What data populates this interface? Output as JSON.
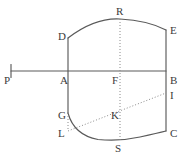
{
  "figure": {
    "type": "geometry-diagram",
    "canvas": {
      "width": 190,
      "height": 159,
      "background": "#ffffff"
    },
    "stroke_colors": {
      "solid": "#5a5a5a",
      "dotted": "#8a8a8a",
      "label": "#3b3b3b"
    },
    "vertices": [
      {
        "id": "P",
        "label": "P",
        "x": 11,
        "y": 71,
        "label_x": 4,
        "label_y": 75
      },
      {
        "id": "A",
        "label": "A",
        "x": 68,
        "y": 71,
        "label_x": 60,
        "label_y": 75
      },
      {
        "id": "F",
        "label": "F",
        "x": 120,
        "y": 71,
        "label_x": 112,
        "label_y": 75
      },
      {
        "id": "B",
        "label": "B",
        "x": 166,
        "y": 71,
        "label_x": 170,
        "label_y": 75
      },
      {
        "id": "D",
        "label": "D",
        "x": 68,
        "y": 38,
        "label_x": 58,
        "label_y": 31
      },
      {
        "id": "R",
        "label": "R",
        "x": 120,
        "y": 19,
        "label_x": 116,
        "label_y": 6
      },
      {
        "id": "E",
        "label": "E",
        "x": 166,
        "y": 30,
        "label_x": 170,
        "label_y": 25
      },
      {
        "id": "G",
        "label": "G",
        "x": 68,
        "y": 113,
        "label_x": 58,
        "label_y": 110
      },
      {
        "id": "I",
        "label": "I",
        "x": 166,
        "y": 93,
        "label_x": 170,
        "label_y": 90
      },
      {
        "id": "K",
        "label": "K",
        "x": 120,
        "y": 115,
        "label_x": 111,
        "label_y": 110
      },
      {
        "id": "L",
        "label": "L",
        "x": 68,
        "y": 131,
        "label_x": 58,
        "label_y": 128
      },
      {
        "id": "C",
        "label": "C",
        "x": 166,
        "y": 131,
        "label_x": 170,
        "label_y": 128
      },
      {
        "id": "S",
        "label": "S",
        "x": 120,
        "y": 140,
        "label_x": 115,
        "label_y": 143
      }
    ],
    "segments": [
      {
        "name": "baseline-P-B",
        "from": "P",
        "to": "B",
        "style": "solid"
      },
      {
        "name": "tick-at-P",
        "style": "solid",
        "kind": "tick"
      },
      {
        "name": "left-edge-D-G",
        "from": "D",
        "to": "G",
        "style": "solid"
      },
      {
        "name": "right-edge-E-C",
        "from": "E",
        "to": "C",
        "style": "solid"
      },
      {
        "name": "axis-R-S",
        "from": "R",
        "to": "S",
        "style": "dotted"
      },
      {
        "name": "chord-L-I",
        "from": "L",
        "to": "I",
        "style": "dotted"
      },
      {
        "name": "segment-G-L",
        "from": "G",
        "to": "L",
        "style": "dotted"
      }
    ],
    "arcs": [
      {
        "name": "top-arc-D-R-E",
        "from": "D",
        "through": "R",
        "to": "E",
        "style": "solid",
        "bulge": "up"
      },
      {
        "name": "bottom-arc-G-S-C",
        "from": "G",
        "through": "S",
        "to": "C",
        "style": "solid",
        "bulge": "down"
      }
    ]
  }
}
